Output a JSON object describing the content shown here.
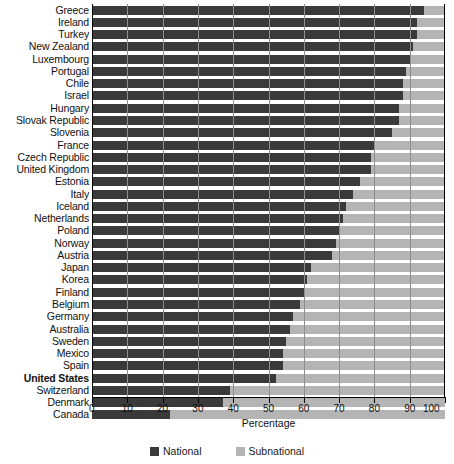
{
  "chart_data": {
    "type": "bar",
    "orientation": "horizontal",
    "stacked": true,
    "title": "",
    "xlabel": "Percentage",
    "ylabel": "",
    "xlim": [
      0,
      100
    ],
    "xticks": [
      0,
      10,
      20,
      30,
      40,
      50,
      60,
      70,
      80,
      90,
      100
    ],
    "grid": true,
    "legend_position": "bottom",
    "legend": [
      "National",
      "Subnational"
    ],
    "categories": [
      "Greece",
      "Ireland",
      "Turkey",
      "New Zealand",
      "Luxembourg",
      "Portugal",
      "Chile",
      "Israel",
      "Hungary",
      "Slovak Republic",
      "Slovenia",
      "France",
      "Czech Republic",
      "United Kingdom",
      "Estonia",
      "Italy",
      "Iceland",
      "Netherlands",
      "Poland",
      "Norway",
      "Austria",
      "Japan",
      "Korea",
      "Finland",
      "Belgium",
      "Germany",
      "Australia",
      "Sweden",
      "Mexico",
      "Spain",
      "United States",
      "Switzerland",
      "Denmark",
      "Canada"
    ],
    "series": [
      {
        "name": "National",
        "color": "#3a3a3a",
        "values": [
          94,
          92,
          92,
          91,
          90,
          89,
          88,
          88,
          87,
          87,
          85,
          80,
          79,
          79,
          76,
          74,
          72,
          71,
          70,
          69,
          68,
          62,
          61,
          60,
          59,
          57,
          56,
          55,
          54,
          54,
          52,
          39,
          37,
          22
        ]
      },
      {
        "name": "Subnational",
        "color": "#b4b4b4",
        "values": [
          6,
          8,
          8,
          9,
          10,
          11,
          12,
          12,
          13,
          13,
          15,
          20,
          21,
          21,
          24,
          26,
          28,
          29,
          30,
          31,
          32,
          38,
          39,
          40,
          41,
          43,
          44,
          45,
          46,
          46,
          48,
          61,
          63,
          78
        ]
      }
    ],
    "highlighted_category": "United States"
  },
  "legend": {
    "items": [
      {
        "label": "National",
        "color": "#3a3a3a"
      },
      {
        "label": "Subnational",
        "color": "#b4b4b4"
      }
    ]
  },
  "axis": {
    "title": "Percentage",
    "ticks": [
      "0",
      "10",
      "20",
      "30",
      "40",
      "50",
      "60",
      "70",
      "80",
      "90",
      "100"
    ]
  }
}
